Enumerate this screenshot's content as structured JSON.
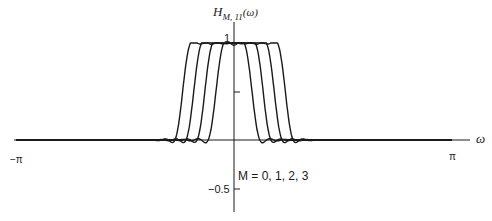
{
  "chart_data": {
    "type": "line",
    "title": "",
    "ylabel": "H_{M,11}(ω)",
    "ylabel_main": "H",
    "ylabel_sub": "M, 11",
    "ylabel_arg": "(ω)",
    "xlabel": "ω",
    "xlim": [
      -3.14159,
      3.14159
    ],
    "ylim": [
      -0.5,
      1
    ],
    "x_tick_labels": [
      "−π",
      "π"
    ],
    "y_tick_labels": [
      "1",
      "−0.5"
    ],
    "y_ticks": [
      1,
      0.5,
      -0.5
    ],
    "grid": false,
    "annotation": "M = 0,  1,  2,  3",
    "series": [
      {
        "name": "M = 0",
        "cutoff": 0.26,
        "peak": 1.0
      },
      {
        "name": "M = 1",
        "cutoff": 0.42,
        "peak": 1.0
      },
      {
        "name": "M = 2",
        "cutoff": 0.58,
        "peak": 1.0
      },
      {
        "name": "M = 3",
        "cutoff": 0.74,
        "peak": 1.0
      }
    ],
    "taps": 11,
    "line_color": "#1a1a1a"
  },
  "labels": {
    "y_axis_main": "H",
    "y_axis_sub": "M, 11",
    "y_axis_arg": "(ω)",
    "x_axis": "ω",
    "tick_one": "1",
    "tick_neg_half": "−0.5",
    "tick_neg_pi": "−π",
    "tick_pi": "π",
    "legend": "M = 0,  1,  2,  3"
  }
}
